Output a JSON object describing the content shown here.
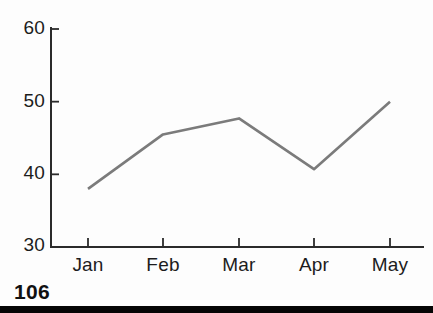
{
  "chart_data": {
    "type": "line",
    "categories": [
      "Jan",
      "Feb",
      "Mar",
      "Apr",
      "May"
    ],
    "values": [
      38,
      45.5,
      47.7,
      40.7,
      50
    ],
    "yticks": [
      30,
      40,
      50,
      60
    ],
    "ytick_labels": [
      "30",
      "40",
      "50",
      "60"
    ],
    "ylim": [
      30,
      60
    ],
    "grid": false,
    "legend": "none",
    "line_color": "#7b7b7b",
    "axis_color": "#2b2b2b",
    "text_color": "#1c1c1c"
  },
  "footer": {
    "page_number": "106"
  }
}
